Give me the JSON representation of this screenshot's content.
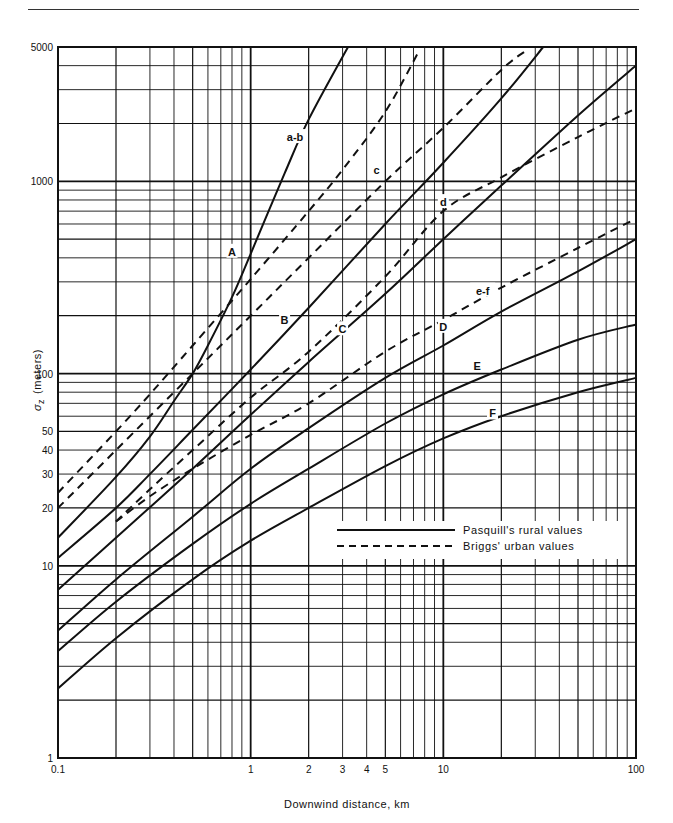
{
  "chart_data": {
    "type": "line",
    "title": "",
    "xlabel": "Downwind distance, km",
    "ylabel": "σz (meters)",
    "ylabel_symbol": "σ",
    "ylabel_sub": "z",
    "ylabel_unit": "(meters)",
    "xscale": "log",
    "yscale": "log",
    "xlim": [
      0.1,
      100
    ],
    "ylim": [
      1,
      5000
    ],
    "grid": true,
    "x_ticks": [
      {
        "value": 0.1,
        "label": "0.1"
      },
      {
        "value": 1,
        "label": "1"
      },
      {
        "value": 2,
        "label": "2"
      },
      {
        "value": 3,
        "label": "3"
      },
      {
        "value": 4,
        "label": "4"
      },
      {
        "value": 5,
        "label": "5"
      },
      {
        "value": 10,
        "label": "10"
      },
      {
        "value": 100,
        "label": "100"
      }
    ],
    "y_ticks": [
      {
        "value": 1,
        "label": "1"
      },
      {
        "value": 10,
        "label": "10"
      },
      {
        "value": 20,
        "label": "20"
      },
      {
        "value": 30,
        "label": "30"
      },
      {
        "value": 40,
        "label": "40"
      },
      {
        "value": 50,
        "label": "50"
      },
      {
        "value": 100,
        "label": "100"
      },
      {
        "value": 1000,
        "label": "1000"
      },
      {
        "value": 5000,
        "label": "5000"
      }
    ],
    "legend": {
      "position": "lower-right inside plot",
      "entries": [
        {
          "label": "Pasquill's rural values",
          "style": "solid"
        },
        {
          "label": "Briggs' urban values",
          "style": "dashed"
        }
      ]
    },
    "series": [
      {
        "name": "A",
        "group": "Pasquill rural",
        "style": "solid",
        "x": [
          0.1,
          0.2,
          0.3,
          0.4,
          0.5,
          0.6,
          0.8,
          1,
          1.5,
          2,
          3.2
        ],
        "y": [
          14,
          29,
          47,
          72,
          100,
          140,
          250,
          420,
          1100,
          2100,
          5000
        ],
        "label_at": [
          0.8,
          430
        ]
      },
      {
        "name": "B",
        "group": "Pasquill rural",
        "style": "solid",
        "x": [
          0.1,
          0.2,
          0.3,
          0.5,
          1,
          2,
          5,
          10,
          20,
          33
        ],
        "y": [
          11,
          20,
          30,
          51,
          105,
          220,
          600,
          1250,
          2700,
          5000
        ],
        "label_at": [
          1.5,
          190
        ]
      },
      {
        "name": "C",
        "group": "Pasquill rural",
        "style": "solid",
        "x": [
          0.1,
          0.2,
          0.5,
          1,
          2,
          5,
          10,
          20,
          50,
          100
        ],
        "y": [
          7.5,
          14,
          32,
          61,
          115,
          260,
          500,
          950,
          2200,
          4000
        ],
        "label_at": [
          3.0,
          170
        ]
      },
      {
        "name": "D",
        "group": "Pasquill rural",
        "style": "solid",
        "x": [
          0.1,
          0.2,
          0.5,
          1,
          2,
          5,
          10,
          20,
          50,
          100
        ],
        "y": [
          4.6,
          8.5,
          18,
          32,
          52,
          95,
          140,
          210,
          340,
          500
        ],
        "label_at": [
          10,
          175
        ]
      },
      {
        "name": "E",
        "group": "Pasquill rural",
        "style": "solid",
        "x": [
          0.1,
          0.2,
          0.5,
          1,
          2,
          5,
          10,
          20,
          50,
          100
        ],
        "y": [
          3.6,
          6.5,
          13,
          21,
          32,
          55,
          78,
          105,
          150,
          180
        ],
        "label_at": [
          15,
          110
        ]
      },
      {
        "name": "F",
        "group": "Pasquill rural",
        "style": "solid",
        "x": [
          0.1,
          0.2,
          0.5,
          1,
          2,
          5,
          10,
          20,
          50,
          100
        ],
        "y": [
          2.3,
          4.2,
          8.5,
          13.5,
          20,
          33,
          46,
          60,
          80,
          95
        ],
        "label_at": [
          18,
          62
        ]
      },
      {
        "name": "a-b",
        "group": "Briggs urban",
        "style": "dashed",
        "x": [
          0.1,
          0.2,
          0.3,
          0.5,
          1,
          2,
          3,
          5,
          7.5
        ],
        "y": [
          24,
          50,
          78,
          140,
          310,
          700,
          1150,
          2300,
          4800
        ],
        "label_at": [
          1.7,
          1700
        ]
      },
      {
        "name": "c",
        "group": "Briggs urban",
        "style": "dashed",
        "x": [
          0.1,
          0.2,
          0.5,
          1,
          2,
          5,
          10,
          20,
          27
        ],
        "y": [
          20,
          40,
          100,
          200,
          400,
          1000,
          1900,
          3800,
          4800
        ],
        "label_at": [
          4.5,
          1150
        ]
      },
      {
        "name": "d",
        "group": "Briggs urban",
        "style": "dashed",
        "x": [
          0.2,
          0.3,
          0.5,
          1,
          2,
          5,
          10,
          20,
          50,
          100
        ],
        "y": [
          17,
          25,
          40,
          75,
          130,
          320,
          700,
          1050,
          1700,
          2400
        ],
        "label_at": [
          10,
          780
        ]
      },
      {
        "name": "e-f",
        "group": "Briggs urban",
        "style": "dashed",
        "x": [
          0.2,
          0.3,
          0.5,
          1,
          2,
          5,
          10,
          20,
          50,
          100
        ],
        "y": [
          17,
          23,
          32,
          48,
          70,
          130,
          190,
          280,
          450,
          640
        ],
        "label_at": [
          16,
          270
        ]
      }
    ]
  }
}
